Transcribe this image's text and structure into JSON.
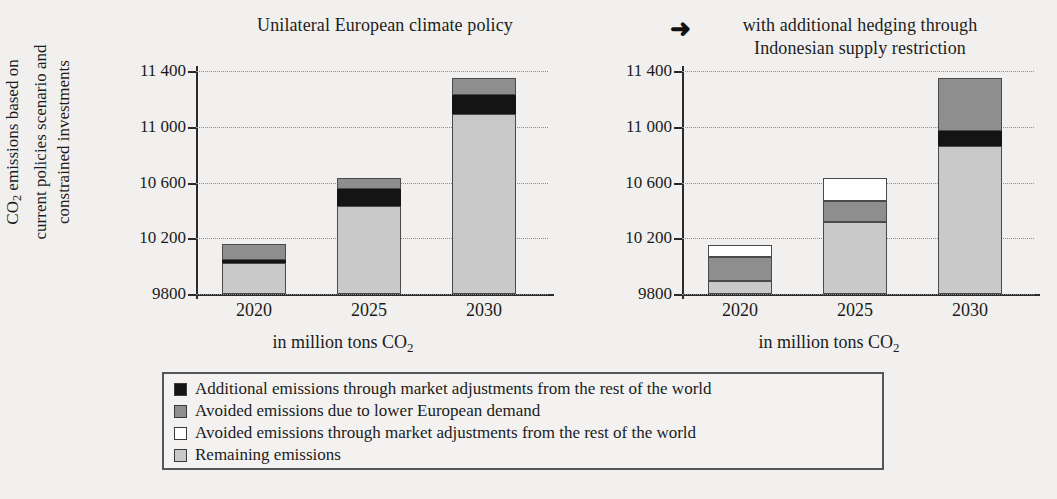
{
  "figure": {
    "arrow_glyph": "➜",
    "panels": [
      {
        "id": "left",
        "title": "Unilateral European climate policy",
        "x_caption_prefix": "in million tons CO",
        "x_caption_sub": "2"
      },
      {
        "id": "right",
        "title_line1": "with additional hedging through",
        "title_line2": "Indonesian supply restriction",
        "x_caption_prefix": "in million tons CO",
        "x_caption_sub": "2"
      }
    ]
  },
  "y_axis_caption": {
    "line1_prefix": "CO",
    "line1_sub": "2",
    "line1_rest": " emissions based on",
    "line2": "current policies scenario and",
    "line3": "constrained investments"
  },
  "axis": {
    "ticks": [
      "11 400",
      "11 000",
      "10 600",
      "10 200",
      "9800"
    ],
    "tick_values": [
      11400,
      11000,
      10600,
      10200,
      9800
    ],
    "min": 9800,
    "max": 11400,
    "categories": [
      "2020",
      "2025",
      "2030"
    ]
  },
  "legend": {
    "items": [
      {
        "swatch": "black",
        "color": "#141414",
        "label": "Additional emissions through market adjustments from the rest of the world"
      },
      {
        "swatch": "dark",
        "color": "#8e8e8e",
        "label": "Avoided emissions due to lower European demand"
      },
      {
        "swatch": "white",
        "color": "#ffffff",
        "label": "Avoided emissions through market adjustments from the rest of the world"
      },
      {
        "swatch": "light",
        "color": "#c9c9c9",
        "label": "Remaining emissions"
      }
    ]
  },
  "chart_data": [
    {
      "type": "bar",
      "stacked": true,
      "title": "Unilateral European climate policy",
      "xlabel": "in million tons CO2",
      "ylabel": "CO2 emissions based on current policies scenario and constrained investments",
      "ylim": [
        9800,
        11400
      ],
      "yticks": [
        9800,
        10200,
        10600,
        11000,
        11400
      ],
      "grid": true,
      "legend_position": "below-both-panels",
      "categories": [
        "2020",
        "2025",
        "2030"
      ],
      "series": [
        {
          "name": "Remaining emissions",
          "color": "#c9c9c9",
          "values": [
            10025,
            10430,
            11090
          ]
        },
        {
          "name": "Additional emissions through market adjustments from the rest of the world",
          "color": "#141414",
          "values": [
            20,
            125,
            140
          ]
        },
        {
          "name": "Avoided emissions due to lower European demand",
          "color": "#8e8e8e",
          "values": [
            110,
            80,
            120
          ]
        },
        {
          "name": "Avoided emissions through market adjustments from the rest of the world",
          "color": "#ffffff",
          "values": [
            0,
            0,
            0
          ]
        }
      ],
      "totals": [
        10155,
        10635,
        11350
      ]
    },
    {
      "type": "bar",
      "stacked": true,
      "title": "with additional hedging through Indonesian supply restriction",
      "xlabel": "in million tons CO2",
      "ylabel": "CO2 emissions based on current policies scenario and constrained investments",
      "ylim": [
        9800,
        11400
      ],
      "yticks": [
        9800,
        10200,
        10600,
        11000,
        11400
      ],
      "grid": true,
      "legend_position": "below-both-panels",
      "categories": [
        "2020",
        "2025",
        "2030"
      ],
      "series": [
        {
          "name": "Remaining emissions",
          "color": "#c9c9c9",
          "values": [
            9890,
            10320,
            10860
          ]
        },
        {
          "name": "Additional emissions through market adjustments from the rest of the world",
          "color": "#141414",
          "values": [
            0,
            0,
            110
          ]
        },
        {
          "name": "Avoided emissions due to lower European demand",
          "color": "#8e8e8e",
          "values": [
            175,
            150,
            380
          ]
        },
        {
          "name": "Avoided emissions through market adjustments from the rest of the world",
          "color": "#ffffff",
          "values": [
            90,
            165,
            0
          ]
        }
      ],
      "totals": [
        10155,
        10635,
        11350
      ]
    }
  ],
  "bars": {
    "left": [
      {
        "category": "2020",
        "segments": [
          {
            "kind": "light",
            "value": 225
          },
          {
            "kind": "black",
            "value": 20
          },
          {
            "kind": "dark",
            "value": 110
          }
        ]
      },
      {
        "category": "2025",
        "segments": [
          {
            "kind": "light",
            "value": 630
          },
          {
            "kind": "black",
            "value": 125
          },
          {
            "kind": "dark",
            "value": 80
          }
        ]
      },
      {
        "category": "2030",
        "segments": [
          {
            "kind": "light",
            "value": 1290
          },
          {
            "kind": "black",
            "value": 140
          },
          {
            "kind": "dark",
            "value": 120
          }
        ]
      }
    ],
    "right": [
      {
        "category": "2020",
        "segments": [
          {
            "kind": "light",
            "value": 90
          },
          {
            "kind": "dark",
            "value": 175
          },
          {
            "kind": "white",
            "value": 90
          }
        ]
      },
      {
        "category": "2025",
        "segments": [
          {
            "kind": "light",
            "value": 520
          },
          {
            "kind": "dark",
            "value": 150
          },
          {
            "kind": "white",
            "value": 165
          }
        ]
      },
      {
        "category": "2030",
        "segments": [
          {
            "kind": "light",
            "value": 1060
          },
          {
            "kind": "black",
            "value": 110
          },
          {
            "kind": "dark",
            "value": 380
          }
        ]
      }
    ]
  }
}
